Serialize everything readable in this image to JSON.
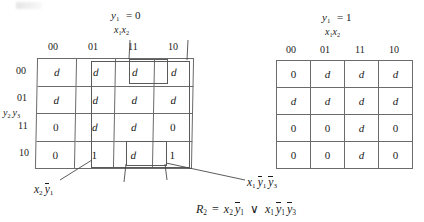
{
  "figure": {
    "kind": "karnaugh-map-pair",
    "equation_prefix": "R",
    "equation_sub": "2",
    "equation_eq": "=",
    "equation_or": "∨"
  },
  "maps": [
    {
      "id": "left",
      "title_var": "y",
      "title_sub": "1",
      "title_eq": "= 0",
      "col_var_1": "x",
      "col_var_1_sub": "1",
      "col_var_2": "x",
      "col_var_2_sub": "2",
      "row_var_1": "y",
      "row_var_1_sub": "2",
      "row_var_2": "y",
      "row_var_2_sub": "3",
      "col_headers": [
        "00",
        "01",
        "11",
        "10"
      ],
      "row_headers": [
        "00",
        "01",
        "11",
        "10"
      ],
      "cells": [
        [
          "d",
          "d",
          "d",
          "d"
        ],
        [
          "d",
          "d",
          "d",
          "d"
        ],
        [
          "0",
          "d",
          "d",
          "0"
        ],
        [
          "0",
          "1",
          "d",
          "1"
        ]
      ]
    },
    {
      "id": "right",
      "title_var": "y",
      "title_sub": "1",
      "title_eq": "= 1",
      "col_var_1": "x",
      "col_var_1_sub": "1",
      "col_var_2": "x",
      "col_var_2_sub": "2",
      "col_headers": [
        "00",
        "01",
        "11",
        "10"
      ],
      "cells": [
        [
          "0",
          "d",
          "d",
          "d"
        ],
        [
          "d",
          "d",
          "d",
          "d"
        ],
        [
          "0",
          "0",
          "d",
          "0"
        ],
        [
          "0",
          "0",
          "d",
          "0"
        ]
      ]
    }
  ],
  "annotations": [
    {
      "id": "term-1",
      "parts": [
        {
          "v": "x",
          "sub": "2",
          "bar": false
        },
        {
          "v": "y",
          "sub": "1",
          "bar": true
        }
      ]
    },
    {
      "id": "term-2",
      "parts": [
        {
          "v": "x",
          "sub": "1",
          "bar": false
        },
        {
          "v": "y",
          "sub": "1",
          "bar": true
        },
        {
          "v": "y",
          "sub": "3",
          "bar": true
        }
      ]
    }
  ],
  "equation": {
    "lhs_var": "R",
    "lhs_sub": "2",
    "eq": "=",
    "term1": [
      {
        "v": "x",
        "sub": "2",
        "bar": false
      },
      {
        "v": "y",
        "sub": "1",
        "bar": true
      }
    ],
    "or": "∨",
    "term2": [
      {
        "v": "x",
        "sub": "1",
        "bar": false
      },
      {
        "v": "y",
        "sub": "1",
        "bar": true
      },
      {
        "v": "y",
        "sub": "3",
        "bar": true
      }
    ]
  }
}
